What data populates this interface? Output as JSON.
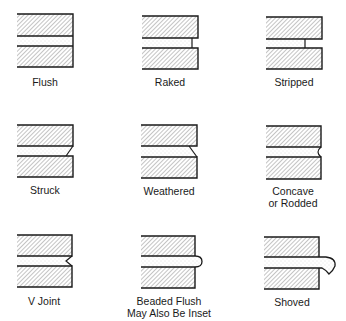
{
  "colors": {
    "line": "#1a1a1a",
    "hatch": "#8a8a8a",
    "mortar_dots": "#b5b5b5",
    "background": "#ffffff"
  },
  "joints": [
    {
      "id": "flush",
      "label": "Flush",
      "label2": ""
    },
    {
      "id": "raked",
      "label": "Raked",
      "label2": ""
    },
    {
      "id": "stripped",
      "label": "Stripped",
      "label2": ""
    },
    {
      "id": "struck",
      "label": "Struck",
      "label2": ""
    },
    {
      "id": "weathered",
      "label": "Weathered",
      "label2": ""
    },
    {
      "id": "concave",
      "label": "Concave",
      "label2": "or Rodded"
    },
    {
      "id": "v-joint",
      "label": "V Joint",
      "label2": ""
    },
    {
      "id": "beaded-flush",
      "label": "Beaded Flush",
      "label2": "May Also Be Inset"
    },
    {
      "id": "shoved",
      "label": "Shoved",
      "label2": ""
    }
  ]
}
